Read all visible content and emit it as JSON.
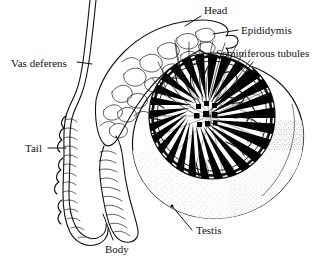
{
  "figure": {
    "background_color": "#ffffff",
    "ink_color": "#000000",
    "style": "black-and-white line engraving"
  },
  "labels": {
    "head": "Head",
    "epididymis": "Epididymis",
    "seminiferous_tubules": "Seminiferous tubules",
    "vas_deferens": "Vas deferens",
    "tail": "Tail",
    "body": "Body",
    "testis": "Testis"
  },
  "structures": [
    {
      "name": "head-of-epididymis",
      "label": "Head"
    },
    {
      "name": "epididymis",
      "label": "Epididymis"
    },
    {
      "name": "seminiferous-tubules",
      "label": "Seminiferous tubules"
    },
    {
      "name": "vas-deferens",
      "label": "Vas deferens"
    },
    {
      "name": "tail-of-epididymis",
      "label": "Tail"
    },
    {
      "name": "body-of-epididymis",
      "label": "Body"
    },
    {
      "name": "testis",
      "label": "Testis"
    }
  ]
}
